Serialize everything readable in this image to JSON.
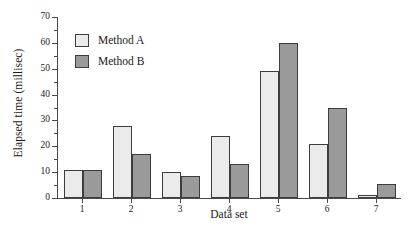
{
  "chart_data": {
    "type": "bar",
    "title": "",
    "xlabel": "Data set",
    "ylabel": "Elapsed time (millisec)",
    "categories": [
      "1",
      "2",
      "3",
      "4",
      "5",
      "6",
      "7"
    ],
    "series": [
      {
        "name": "Method A",
        "color": "#ebebeb",
        "values": [
          11,
          28,
          10,
          24,
          49,
          21,
          1
        ]
      },
      {
        "name": "Method B",
        "color": "#9a9a9a",
        "values": [
          11,
          17,
          8.5,
          13,
          60,
          35,
          5.5
        ]
      }
    ],
    "ylim": [
      0,
      70
    ],
    "ytick_labels": [
      "0",
      "10",
      "20",
      "30",
      "40",
      "50",
      "60",
      "70"
    ],
    "ytick_values": [
      0,
      10,
      20,
      30,
      40,
      50,
      60,
      70
    ],
    "yminor_values": [
      5,
      15,
      25,
      35,
      45,
      55,
      65
    ],
    "grid": false,
    "legend_position": "top-left",
    "legend": [
      "Method A",
      "Method B"
    ],
    "axis_color": "#4a4a4a",
    "bar_edge_color": "#3d3d3d"
  }
}
